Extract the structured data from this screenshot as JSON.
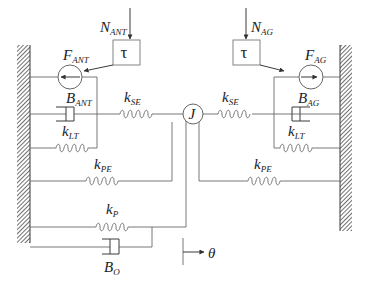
{
  "diagram": {
    "type": "mechanical spring-damper model of antagonist/agonist muscle pair acting on joint inertia",
    "left_side": {
      "torque_input": {
        "main": "N",
        "sub": "ANT"
      },
      "activation_block": "τ",
      "force_generator": {
        "main": "F",
        "sub": "ANT"
      },
      "damper": {
        "main": "B",
        "sub": "ANT"
      },
      "series_spring": {
        "main": "k",
        "sub": "SE"
      },
      "tendon_spring": {
        "main": "k",
        "sub": "LT"
      },
      "parallel_spring": {
        "main": "k",
        "sub": "PE"
      }
    },
    "right_side": {
      "torque_input": {
        "main": "N",
        "sub": "AG"
      },
      "activation_block": "τ",
      "force_generator": {
        "main": "F",
        "sub": "AG"
      },
      "damper": {
        "main": "B",
        "sub": "AG"
      },
      "series_spring": {
        "main": "k",
        "sub": "SE"
      },
      "tendon_spring": {
        "main": "k",
        "sub": "LT"
      },
      "parallel_spring": {
        "main": "k",
        "sub": "PE"
      }
    },
    "joint": {
      "label": "J"
    },
    "passive": {
      "spring": {
        "main": "k",
        "sub": "P"
      },
      "damper": {
        "main": "B",
        "sub": "O"
      }
    },
    "displacement": {
      "label": "θ"
    }
  }
}
